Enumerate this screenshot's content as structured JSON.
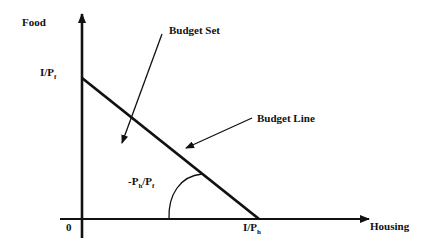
{
  "diagram": {
    "type": "budget-constraint",
    "colors": {
      "background": "#ffffff",
      "ink": "#111111"
    },
    "axes": {
      "y_label": "Food",
      "x_label": "Housing",
      "origin_label": "0"
    },
    "intercepts": {
      "y_main": "I/P",
      "y_sub": "f",
      "x_main": "I/P",
      "x_sub": "h"
    },
    "annotations": {
      "budget_set": "Budget Set",
      "budget_line": "Budget Line",
      "slope_prefix": "-P",
      "slope_sub1": "h",
      "slope_mid": "/P",
      "slope_sub2": "f"
    }
  }
}
